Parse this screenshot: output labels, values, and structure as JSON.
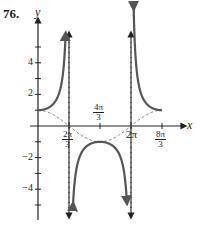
{
  "problem_number": "76.",
  "chart_data": {
    "type": "line",
    "title": "",
    "xlabel": "x",
    "ylabel": "y",
    "x_ticks": [
      {
        "value": 2.0944,
        "label": "2π/3",
        "num": "2π",
        "den": "3"
      },
      {
        "value": 4.1888,
        "label": "4π/3",
        "num": "4π",
        "den": "3"
      },
      {
        "value": 6.2832,
        "label": "2π"
      },
      {
        "value": 8.3776,
        "label": "8π/3",
        "num": "8π",
        "den": "3"
      }
    ],
    "y_ticks": [
      -5,
      -4,
      -3,
      -2,
      -1,
      1,
      2,
      3,
      4,
      5
    ],
    "y_tick_labels": {
      "4": "4",
      "2": "2",
      "-2": "−2",
      "-4": "−4"
    },
    "xlim": [
      0,
      8.3776
    ],
    "ylim": [
      -5.5,
      5.5
    ],
    "grid": false,
    "series": [
      {
        "name": "y = sec(3x/4)",
        "style": "solid",
        "color": "#555555",
        "branches": [
          {
            "x": [
              0,
              0.5,
              1.0,
              1.4,
              1.7,
              1.85
            ],
            "y": [
              1,
              1.08,
              1.37,
              2.04,
              3.5,
              5.7
            ]
          },
          {
            "x": [
              2.4,
              2.8,
              3.3,
              3.8,
              4.1888,
              4.6,
              5.1,
              5.6,
              6.0
            ],
            "y": [
              -5.7,
              -2.3,
              -1.39,
              -1.08,
              -1,
              -1.08,
              -1.39,
              -2.3,
              -5.7
            ]
          },
          {
            "x": [
              6.45,
              6.8,
              7.3,
              7.8,
              8.3776
            ],
            "y": [
              5.7,
              2.3,
              1.39,
              1.08,
              1
            ]
          }
        ]
      },
      {
        "name": "y = cos(3x/4)",
        "style": "dashed",
        "color": "#888888",
        "x": [
          0,
          2.0944,
          4.1888,
          6.2832,
          8.3776
        ],
        "y": [
          1,
          0,
          -1,
          0,
          1
        ]
      }
    ],
    "asymptotes": [
      {
        "x": 2.0944,
        "style": "dashed"
      },
      {
        "x": 6.2832,
        "style": "dashed"
      }
    ]
  }
}
